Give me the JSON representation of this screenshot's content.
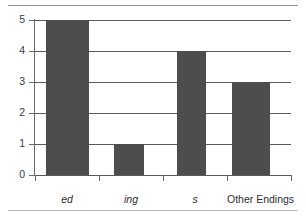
{
  "chart_data": {
    "type": "bar",
    "title": "",
    "xlabel": "",
    "ylabel": "",
    "categories": [
      "ed",
      "ing",
      "s",
      "Other Endings"
    ],
    "values": [
      5,
      1,
      4,
      3
    ],
    "category_styles": [
      "italic",
      "italic",
      "italic",
      "normal"
    ],
    "ylim": [
      0,
      5
    ],
    "ytick_labels": [
      "0",
      "1",
      "2",
      "3",
      "4",
      "5"
    ],
    "ytick_values": [
      0,
      1,
      2,
      3,
      4,
      5
    ],
    "grid": true,
    "grid_axis": "y",
    "legend": false,
    "bar_color": "#4d4d4d",
    "axis_color": "#5a5a5a",
    "background": "#ffffff"
  },
  "axes": {
    "y": {
      "ticks": [
        {
          "label": "5",
          "value": 5
        },
        {
          "label": "4",
          "value": 4
        },
        {
          "label": "3",
          "value": 3
        },
        {
          "label": "2",
          "value": 2
        },
        {
          "label": "1",
          "value": 1
        },
        {
          "label": "0",
          "value": 0
        }
      ]
    },
    "x": {
      "ticks": [
        {
          "label": "ed",
          "style": "italic"
        },
        {
          "label": "ing",
          "style": "italic"
        },
        {
          "label": "s",
          "style": "italic"
        },
        {
          "label": "Other Endings",
          "style": "normal"
        }
      ]
    }
  },
  "bars": [
    {
      "category": "ed",
      "value": 5
    },
    {
      "category": "ing",
      "value": 1
    },
    {
      "category": "s",
      "value": 4
    },
    {
      "category": "Other Endings",
      "value": 3
    }
  ]
}
